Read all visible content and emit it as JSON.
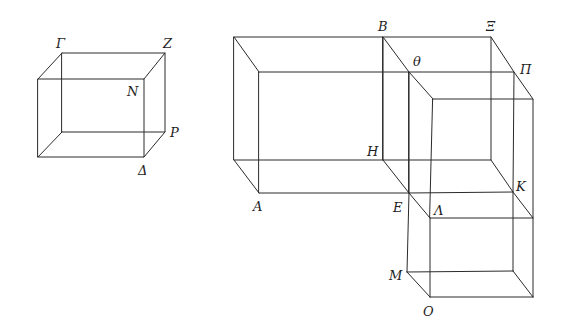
{
  "figure": {
    "type": "geometric-diagram",
    "line_color": "#2a2a2a",
    "background": "#ffffff"
  },
  "labels": {
    "Gamma": "Γ",
    "Z": "Z",
    "N": "N",
    "P": "P",
    "Delta": "Δ",
    "B": "B",
    "Xi": "Ξ",
    "Theta": "θ",
    "Pi": "Π",
    "H": "H",
    "K": "K",
    "A": "A",
    "E": "E",
    "Lambda": "Λ",
    "M": "M",
    "O": "O"
  }
}
